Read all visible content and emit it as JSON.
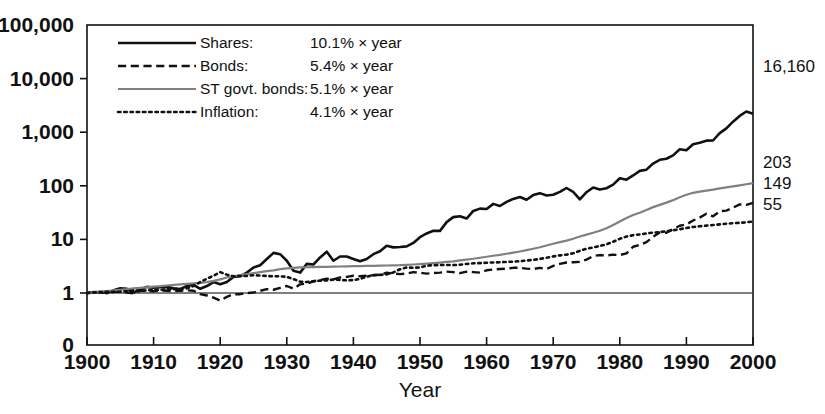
{
  "chart_data": {
    "type": "line",
    "title": "",
    "xlabel": "Year",
    "ylabel": "",
    "scale": "log",
    "grid": false,
    "legend_position": "top-left-inside",
    "xlim": [
      1900,
      2000
    ],
    "ylim": [
      1,
      100000
    ],
    "xticks": [
      1900,
      1910,
      1920,
      1930,
      1940,
      1950,
      1960,
      1970,
      1980,
      1990,
      2000
    ],
    "xtick_labels": [
      "1900",
      "1910",
      "1920",
      "1930",
      "1940",
      "1950",
      "1960",
      "1970",
      "1980",
      "1990",
      "2000"
    ],
    "yticks": [
      1,
      10,
      100,
      1000,
      10000,
      100000
    ],
    "ytick_labels": [
      "1",
      "10",
      "100",
      "1,000",
      "10,000",
      "100,000"
    ],
    "y_zero_label": "0",
    "baseline_value": 1,
    "end_labels": [
      {
        "text": "16,160",
        "value": 16160,
        "series": "Shares"
      },
      {
        "text": "203",
        "value": 203,
        "series": "Bonds"
      },
      {
        "text": "149",
        "value": 149,
        "series": "ST govt. bonds"
      },
      {
        "text": "55",
        "value": 55,
        "series": "Inflation"
      }
    ],
    "legend": [
      {
        "label": "Shares:",
        "rate": "10.1% × year",
        "style": "solid",
        "color": "#111111",
        "width": 2.6
      },
      {
        "label": "Bonds:",
        "rate": "5.4% × year",
        "style": "dashed",
        "color": "#111111",
        "width": 2.4
      },
      {
        "label": "ST govt. bonds:",
        "rate": "5.1% × year",
        "style": "solid",
        "color": "#808080",
        "width": 2.2
      },
      {
        "label": "Inflation:",
        "rate": "4.1% × year",
        "style": "dotted",
        "color": "#111111",
        "width": 2.6
      }
    ],
    "x": [
      1900,
      1901,
      1902,
      1903,
      1904,
      1905,
      1906,
      1907,
      1908,
      1909,
      1910,
      1911,
      1912,
      1913,
      1914,
      1915,
      1916,
      1917,
      1918,
      1919,
      1920,
      1921,
      1922,
      1923,
      1924,
      1925,
      1926,
      1927,
      1928,
      1929,
      1930,
      1931,
      1932,
      1933,
      1934,
      1935,
      1936,
      1937,
      1938,
      1939,
      1940,
      1941,
      1942,
      1943,
      1944,
      1945,
      1946,
      1947,
      1948,
      1949,
      1950,
      1951,
      1952,
      1953,
      1954,
      1955,
      1956,
      1957,
      1958,
      1959,
      1960,
      1961,
      1962,
      1963,
      1964,
      1965,
      1966,
      1967,
      1968,
      1969,
      1970,
      1971,
      1972,
      1973,
      1974,
      1975,
      1976,
      1977,
      1978,
      1979,
      1980,
      1981,
      1982,
      1983,
      1984,
      1985,
      1986,
      1987,
      1988,
      1989,
      1990,
      1991,
      1992,
      1993,
      1994,
      1995,
      1996,
      1997,
      1998,
      1999,
      2000
    ],
    "series": [
      {
        "name": "Shares",
        "style": "solid",
        "color": "#111111",
        "width": 2.6,
        "end_value": 16160,
        "values": [
          1,
          1.04,
          1.03,
          1.0,
          1.12,
          1.22,
          1.2,
          1.02,
          1.18,
          1.3,
          1.26,
          1.28,
          1.3,
          1.22,
          1.18,
          1.35,
          1.42,
          1.2,
          1.35,
          1.6,
          1.45,
          1.6,
          2.0,
          2.05,
          2.4,
          3.0,
          3.3,
          4.3,
          5.6,
          5.3,
          4.0,
          2.6,
          2.4,
          3.5,
          3.4,
          4.6,
          5.9,
          4.0,
          4.8,
          4.8,
          4.3,
          3.9,
          4.3,
          5.3,
          6.0,
          7.6,
          7.1,
          7.2,
          7.4,
          8.6,
          11.0,
          12.9,
          14.5,
          14.4,
          21.0,
          26.0,
          27.0,
          24.5,
          34.0,
          37.5,
          37.0,
          46.0,
          42.0,
          50.0,
          57.0,
          62.0,
          55.0,
          67.0,
          73.0,
          66.0,
          68.0,
          77.0,
          91.0,
          77.0,
          56.0,
          76.0,
          93.0,
          85.0,
          90.0,
          105.0,
          138.0,
          130.0,
          156.0,
          190.0,
          200.0,
          260.0,
          305.0,
          320.0,
          370.0,
          480.0,
          460.0,
          595.0,
          635.0,
          695.0,
          700.0,
          960.0,
          1180.0,
          1570.0,
          2010.0,
          2430.0,
          2210.0
        ]
      },
      {
        "name": "Bonds",
        "style": "dashed",
        "color": "#111111",
        "width": 2.4,
        "end_value": 203,
        "values": [
          1,
          1.02,
          1.03,
          1.0,
          1.05,
          1.05,
          1.02,
          0.98,
          1.1,
          1.1,
          1.08,
          1.12,
          1.1,
          1.08,
          1.1,
          1.12,
          1.1,
          0.95,
          0.9,
          0.82,
          0.72,
          0.85,
          0.95,
          0.95,
          1.0,
          1.02,
          1.1,
          1.18,
          1.15,
          1.25,
          1.35,
          1.2,
          1.45,
          1.5,
          1.65,
          1.75,
          1.85,
          1.8,
          1.95,
          2.0,
          2.1,
          2.05,
          2.1,
          2.15,
          2.2,
          2.4,
          2.3,
          2.25,
          2.3,
          2.45,
          2.4,
          2.3,
          2.35,
          2.4,
          2.5,
          2.45,
          2.35,
          2.5,
          2.45,
          2.4,
          2.65,
          2.75,
          2.8,
          2.85,
          2.95,
          2.95,
          2.85,
          2.8,
          2.95,
          2.8,
          3.2,
          3.5,
          3.7,
          3.75,
          3.8,
          4.2,
          4.9,
          5.1,
          5.0,
          5.2,
          5.1,
          5.5,
          7.3,
          7.9,
          8.9,
          11.2,
          13.5,
          13.3,
          15.5,
          18.0,
          19.0,
          22.5,
          25.5,
          30.0,
          27.0,
          33.5,
          34.5,
          39.0,
          45.0,
          44.0,
          48.0
        ]
      },
      {
        "name": "ST govt. bonds",
        "style": "solid",
        "color": "#808080",
        "width": 2.2,
        "end_value": 149,
        "values": [
          1,
          1.03,
          1.06,
          1.09,
          1.12,
          1.15,
          1.18,
          1.22,
          1.25,
          1.28,
          1.31,
          1.34,
          1.38,
          1.42,
          1.45,
          1.48,
          1.52,
          1.55,
          1.6,
          1.68,
          1.8,
          1.95,
          2.05,
          2.15,
          2.25,
          2.35,
          2.45,
          2.55,
          2.65,
          2.78,
          2.88,
          2.95,
          3.0,
          3.02,
          3.04,
          3.06,
          3.08,
          3.1,
          3.12,
          3.14,
          3.16,
          3.18,
          3.2,
          3.22,
          3.24,
          3.26,
          3.28,
          3.3,
          3.35,
          3.4,
          3.45,
          3.52,
          3.6,
          3.7,
          3.8,
          3.9,
          4.05,
          4.2,
          4.35,
          4.55,
          4.75,
          4.95,
          5.15,
          5.4,
          5.65,
          5.95,
          6.3,
          6.7,
          7.15,
          7.7,
          8.3,
          8.9,
          9.5,
          10.3,
          11.3,
          12.3,
          13.3,
          14.5,
          16.2,
          18.5,
          21.5,
          25.0,
          28.5,
          31.5,
          35.5,
          40.0,
          44.0,
          48.5,
          54.0,
          61.0,
          68.0,
          74.0,
          78.0,
          81.5,
          85.0,
          89.5,
          93.5,
          97.5,
          102.0,
          107.0,
          112.0
        ]
      },
      {
        "name": "Inflation",
        "style": "dotted",
        "color": "#111111",
        "width": 2.6,
        "end_value": 55,
        "values": [
          1,
          1.02,
          1.04,
          1.05,
          1.05,
          1.06,
          1.08,
          1.12,
          1.1,
          1.12,
          1.15,
          1.14,
          1.17,
          1.18,
          1.19,
          1.22,
          1.35,
          1.6,
          1.85,
          2.1,
          2.45,
          2.2,
          2.05,
          2.08,
          2.08,
          2.15,
          2.12,
          2.08,
          2.05,
          2.05,
          2.0,
          1.82,
          1.63,
          1.6,
          1.66,
          1.7,
          1.72,
          1.78,
          1.75,
          1.72,
          1.74,
          1.83,
          2.02,
          2.15,
          2.18,
          2.23,
          2.42,
          2.77,
          2.99,
          2.96,
          2.99,
          3.23,
          3.3,
          3.32,
          3.33,
          3.32,
          3.37,
          3.48,
          3.58,
          3.61,
          3.67,
          3.71,
          3.75,
          3.8,
          3.85,
          3.92,
          4.03,
          4.15,
          4.32,
          4.55,
          4.82,
          5.03,
          5.2,
          5.52,
          6.13,
          6.7,
          7.08,
          7.54,
          8.11,
          9.03,
          10.25,
          11.3,
          12.0,
          12.39,
          12.92,
          13.38,
          13.64,
          14.2,
          14.8,
          15.5,
          16.35,
          17.05,
          17.55,
          18.07,
          18.54,
          19.07,
          19.63,
          20.08,
          20.39,
          20.83,
          21.54
        ]
      }
    ]
  }
}
